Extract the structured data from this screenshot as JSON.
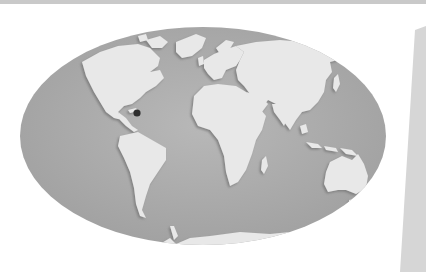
{
  "image": {
    "subject": "world-map",
    "projection": "elliptical",
    "colors": {
      "background": "#ffffff",
      "ocean": "#a9a9a9",
      "land": "#e6e6e6",
      "land_shadow": "#8a8a8a",
      "marker": "#2e2e2e",
      "paper_edge": "#d0d0d0"
    },
    "marker": {
      "label": "",
      "x": 137,
      "y": 113
    },
    "continents": [
      "North America",
      "South America",
      "Europe",
      "Africa",
      "Asia",
      "Australia",
      "Antarctica"
    ]
  }
}
